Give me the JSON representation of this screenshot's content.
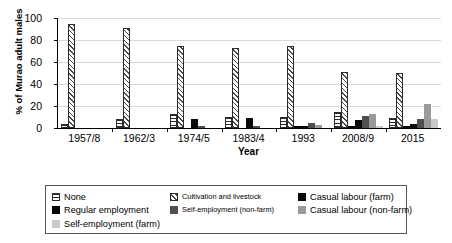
{
  "chart_data": {
    "type": "bar",
    "title": "",
    "xlabel": "Year",
    "ylabel": "% of Murao adult males",
    "ylim": [
      0,
      100
    ],
    "yticks": [
      0,
      20,
      40,
      60,
      80,
      100
    ],
    "grid": true,
    "legend_position": "bottom",
    "categories": [
      "1957/8",
      "1962/3",
      "1974/5",
      "1983/4",
      "1993",
      "2008/9",
      "2015"
    ],
    "series": [
      {
        "name": "None",
        "key": "none",
        "pattern": "horizontal-hatch",
        "color": "#2b2b2b",
        "values": [
          4,
          8,
          13,
          10,
          10,
          15,
          9
        ]
      },
      {
        "name": "Cultivation and livestock",
        "key": "cultivation",
        "pattern": "diagonal-hatch",
        "color": "#4a4a4a",
        "values": [
          95,
          91,
          75,
          73,
          75,
          51,
          50
        ]
      },
      {
        "name": "Regular employment",
        "key": "regular",
        "pattern": "solid",
        "color": "#050505",
        "values": [
          0,
          0,
          0,
          0,
          1,
          2,
          2
        ]
      },
      {
        "name": "Casual labour (farm)",
        "key": "casual_farm",
        "pattern": "solid",
        "color": "#0b0b0b",
        "values": [
          0,
          0,
          8,
          9,
          1,
          7,
          4
        ]
      },
      {
        "name": "Self-employment (non-farm)",
        "key": "self_nonfarm",
        "pattern": "solid",
        "color": "#4f4f4f",
        "values": [
          0,
          0,
          1,
          2,
          5,
          11,
          8
        ]
      },
      {
        "name": "Casual labour (non-farm)",
        "key": "casual_nonfarm",
        "pattern": "solid",
        "color": "#9a9a9a",
        "values": [
          0,
          0,
          0,
          0,
          3,
          13,
          22
        ]
      },
      {
        "name": "Self-employment (farm)",
        "key": "self_farm",
        "pattern": "solid",
        "color": "#c9c9c9",
        "values": [
          0,
          0,
          0,
          0,
          0,
          2,
          8
        ]
      }
    ]
  },
  "axes": {
    "y_title": "% of Murao adult males",
    "x_title": "Year",
    "y_labels": [
      "100",
      "80",
      "60",
      "40",
      "20",
      "0"
    ],
    "x_labels": [
      "1957/8",
      "1962/3",
      "1974/5",
      "1983/4",
      "1993",
      "2008/9",
      "2015"
    ]
  },
  "legend": {
    "items": [
      {
        "label": "None",
        "swatch": "none-swatch"
      },
      {
        "label": "Cultivation and livestock",
        "swatch": "cultivation-swatch"
      },
      {
        "label": "Casual labour (farm)",
        "swatch": "casual-farm-swatch"
      },
      {
        "label": "Regular employment",
        "swatch": "regular-employment-swatch"
      },
      {
        "label": "Self-employment (non-farm)",
        "swatch": "self-employment-nonfarm-swatch"
      },
      {
        "label": "Casual labour (non-farm)",
        "swatch": "casual-labour-nonfarm-swatch"
      },
      {
        "label": "Self-employment (farm)",
        "swatch": "self-employment-farm-swatch"
      }
    ]
  }
}
